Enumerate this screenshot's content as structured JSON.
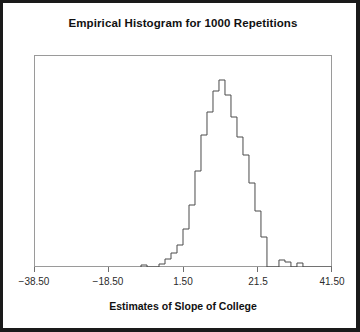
{
  "chart_data": {
    "type": "bar",
    "title": "Empirical Histogram for 1000 Repetitions",
    "xlabel": "Estimates of Slope of College",
    "ylabel": "",
    "grid": false,
    "legend": null,
    "xlim": [
      -38.5,
      41.5
    ],
    "xticks": [
      -38.5,
      -18.5,
      1.5,
      21.5,
      41.5
    ],
    "xtick_labels": [
      "−38.50",
      "−18.50",
      "1.50",
      "21.5",
      "41.50"
    ],
    "bin_width": 1.61,
    "bin_left_edges": [
      -9.77,
      -8.16,
      -6.55,
      -4.94,
      -3.33,
      -1.72,
      -0.11,
      1.5,
      3.11,
      4.72,
      6.33,
      7.94,
      9.55,
      11.16,
      12.77,
      14.38,
      15.99,
      17.6,
      19.21,
      20.82,
      22.43,
      24.04,
      25.65,
      27.26,
      28.87,
      30.48,
      32.09,
      33.7,
      35.31,
      36.92,
      38.53,
      40.14
    ],
    "values": [
      2,
      0,
      0,
      3,
      8,
      14,
      22,
      38,
      62,
      96,
      132,
      155,
      176,
      187,
      172,
      150,
      130,
      112,
      84,
      56,
      30,
      0,
      0,
      7,
      5,
      0,
      4,
      0,
      0,
      0,
      0,
      0
    ],
    "peak_value": 187,
    "peak_bin_left_edge": 11.16,
    "n_repetitions": 1000
  },
  "axis": {
    "tick_positions_px": [
      31,
      105.5,
      180,
      254.5,
      329
    ],
    "tick_labels": [
      "−38.50",
      "−18.50",
      "1.50",
      "21.5",
      "41.50"
    ]
  },
  "style": {
    "outline_color": "#4a4a4a",
    "frame_color": "#9a9a9a",
    "border_color": "#1a1a1a",
    "background": "#ffffff",
    "text_color": "#111111"
  }
}
